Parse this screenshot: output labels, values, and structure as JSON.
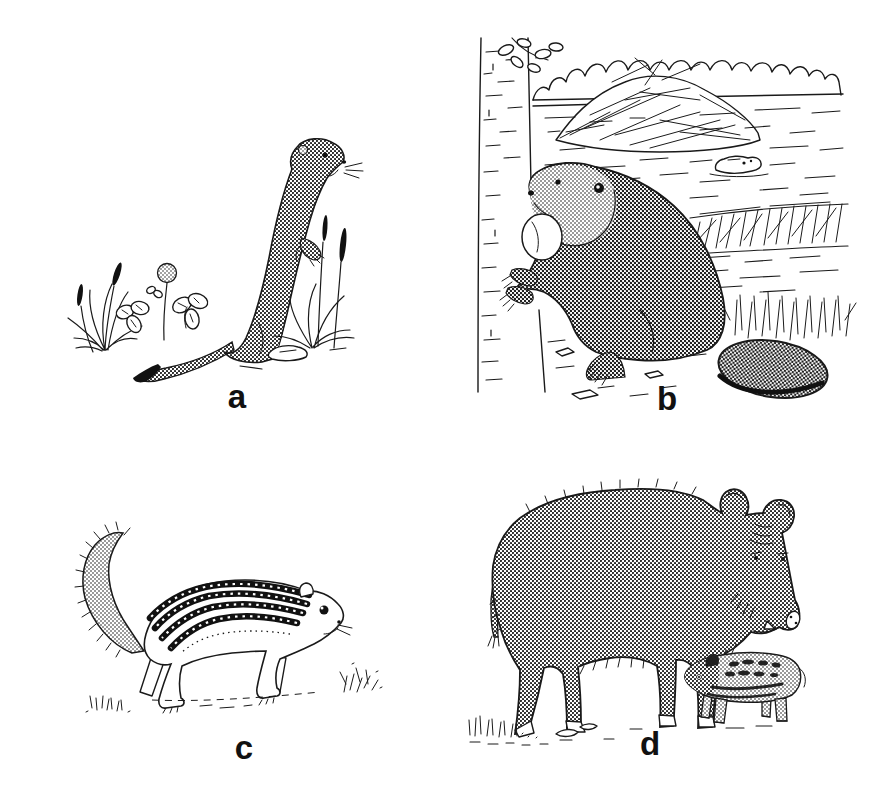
{
  "page": {
    "background_color": "#ffffff",
    "ink_color": "#1a1a1a"
  },
  "figure": {
    "type": "four-panel animal line-art plate",
    "panels": [
      {
        "label": "a",
        "animal": "weasel",
        "scene": "weasel standing upright among grass tufts and clover"
      },
      {
        "label": "b",
        "animal": "beaver",
        "scene": "beaver gnawing a tree trunk beside a pond with lodge, dam and a swimming beaver"
      },
      {
        "label": "c",
        "animal": "striped-ground-squirrel",
        "scene": "striped ground squirrel walking over grass, bushy tail curled up"
      },
      {
        "label": "d",
        "animal": "wild-boar",
        "scene": "wild boar sow standing beside a small striped piglet"
      }
    ]
  }
}
